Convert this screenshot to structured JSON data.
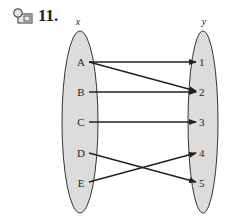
{
  "header": {
    "icon": "video-icon",
    "problem_number": "11."
  },
  "diagram": {
    "type": "mapping-diagram",
    "domain_label": "x",
    "range_label": "y",
    "domain": [
      "A",
      "B",
      "C",
      "D",
      "E"
    ],
    "range": [
      "1",
      "2",
      "3",
      "4",
      "5"
    ],
    "mappings": [
      {
        "from": "A",
        "to": "1"
      },
      {
        "from": "A",
        "to": "2"
      },
      {
        "from": "B",
        "to": "2"
      },
      {
        "from": "C",
        "to": "3"
      },
      {
        "from": "D",
        "to": "5"
      },
      {
        "from": "E",
        "to": "4"
      }
    ],
    "colors": {
      "ellipse_fill": "#dcdcdc",
      "stroke": "#231f20"
    }
  }
}
